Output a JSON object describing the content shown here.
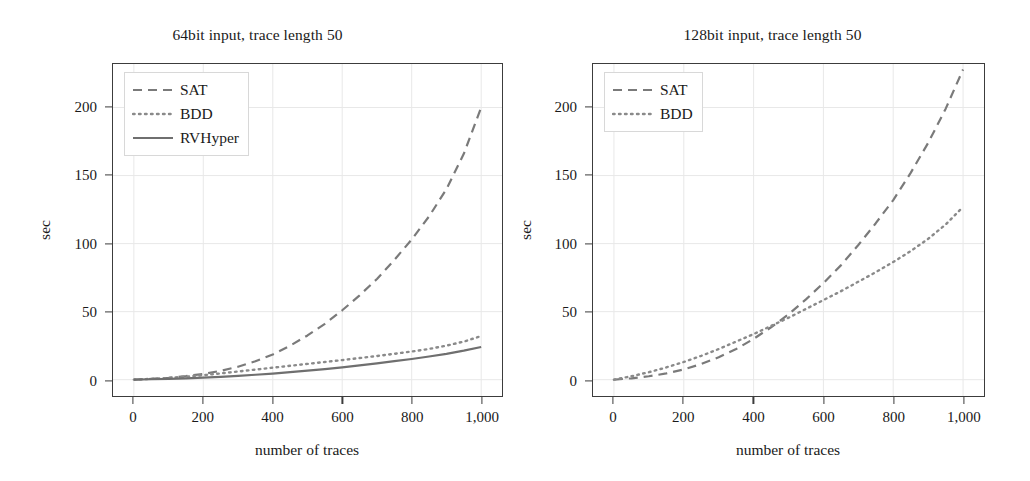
{
  "figure": {
    "background": "#ffffff",
    "axis_color": "#3c3c3c",
    "grid_color": "#e8e8e8"
  },
  "chart_data": [
    {
      "type": "line",
      "title": "64bit input, trace length 50",
      "xlabel": "number of traces",
      "ylabel": "sec",
      "xlim": [
        -60,
        1060
      ],
      "ylim": [
        -12,
        232
      ],
      "xticks": [
        0,
        200,
        400,
        600,
        800,
        1000
      ],
      "xticklabels": [
        "0",
        "200",
        "400",
        "600",
        "800",
        "1,000"
      ],
      "yticks": [
        0,
        50,
        100,
        150,
        200
      ],
      "yticklabels": [
        "0",
        "50",
        "100",
        "150",
        "200"
      ],
      "grid": true,
      "legend_position": "upper left",
      "x": [
        0,
        50,
        100,
        150,
        200,
        250,
        300,
        350,
        400,
        450,
        500,
        550,
        600,
        650,
        700,
        750,
        800,
        850,
        900,
        950,
        1000
      ],
      "series": [
        {
          "name": "SAT",
          "style": "dashed",
          "color": "#7a7a7a",
          "values": [
            0,
            0.6,
            1.4,
            2.6,
            4.2,
            6.5,
            9.5,
            13.5,
            18.5,
            25,
            32.5,
            41,
            51,
            62,
            74,
            88,
            103,
            120,
            140,
            166,
            200
          ]
        },
        {
          "name": "BDD",
          "style": "dotted",
          "color": "#8a8a8a",
          "values": [
            0,
            0.6,
            1.3,
            2.2,
            3.3,
            4.6,
            6.0,
            7.4,
            8.8,
            10.2,
            11.6,
            13.0,
            14.4,
            15.9,
            17.4,
            19.0,
            20.7,
            22.6,
            25.0,
            28.0,
            32.0
          ]
        },
        {
          "name": "RVHyper",
          "style": "solid",
          "color": "#6f6f6f",
          "values": [
            0,
            0.3,
            0.6,
            1.0,
            1.5,
            2.1,
            2.8,
            3.6,
            4.5,
            5.5,
            6.6,
            7.8,
            9.1,
            10.5,
            12.0,
            13.6,
            15.2,
            17.0,
            19.0,
            21.3,
            24.0
          ]
        }
      ]
    },
    {
      "type": "line",
      "title": "128bit input, trace length 50",
      "xlabel": "number of traces",
      "ylabel": "sec",
      "xlim": [
        -60,
        1060
      ],
      "ylim": [
        -12,
        232
      ],
      "xticks": [
        0,
        200,
        400,
        600,
        800,
        1000
      ],
      "xticklabels": [
        "0",
        "200",
        "400",
        "600",
        "800",
        "1,000"
      ],
      "yticks": [
        0,
        50,
        100,
        150,
        200
      ],
      "yticklabels": [
        "0",
        "50",
        "100",
        "150",
        "200"
      ],
      "grid": true,
      "legend_position": "upper left",
      "x": [
        0,
        50,
        100,
        150,
        200,
        250,
        300,
        350,
        400,
        450,
        500,
        550,
        600,
        650,
        700,
        750,
        800,
        850,
        900,
        950,
        1000
      ],
      "series": [
        {
          "name": "SAT",
          "style": "dashed",
          "color": "#7a7a7a",
          "values": [
            0,
            1.0,
            2.5,
            4.6,
            7.5,
            11.5,
            16.5,
            22.5,
            30,
            38.5,
            48,
            59,
            71,
            84,
            99,
            115,
            132,
            152,
            174,
            199,
            228
          ]
        },
        {
          "name": "BDD",
          "style": "dotted",
          "color": "#8a8a8a",
          "values": [
            0,
            2.5,
            5.5,
            9.0,
            13.0,
            17.5,
            22.5,
            28.0,
            33.5,
            39.5,
            45.5,
            52.0,
            58.5,
            65.0,
            72.0,
            79.0,
            86.5,
            94.5,
            103.5,
            114.0,
            127.0
          ]
        }
      ]
    }
  ]
}
